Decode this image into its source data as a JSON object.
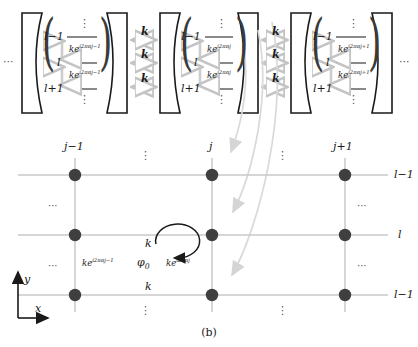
{
  "figure": {
    "caption": "(b)",
    "ellipsis_left": "···",
    "ellipsis_right": "···",
    "vdots": "⋮",
    "hdots": "···"
  },
  "cavity_panel": {
    "cavities": [
      {
        "id": "cavity-j-minus-1",
        "levels": [
          "l−1",
          "l",
          "l+1"
        ],
        "coupling_labels": [
          "ke",
          "ke"
        ],
        "coupling_exponents": [
          "i2παj−1",
          "i2παj−1"
        ]
      },
      {
        "id": "cavity-j",
        "levels": [
          "l−1",
          "l",
          "l+1"
        ],
        "coupling_labels": [
          "ke",
          "ke"
        ],
        "coupling_exponents": [
          "i2παj",
          "i2παj"
        ]
      },
      {
        "id": "cavity-j-plus-1",
        "levels": [
          "l−1",
          "l",
          "l+1"
        ],
        "coupling_labels": [
          "ke",
          "ke"
        ],
        "coupling_exponents": [
          "i2παj+1",
          "i2παj+1"
        ]
      }
    ],
    "inter_cavity_couplings": [
      "k",
      "k",
      "k",
      "k",
      "k",
      "k"
    ]
  },
  "lattice": {
    "column_labels": [
      "j−1",
      "j",
      "j+1"
    ],
    "row_labels": [
      "l−1",
      "l",
      "l−1"
    ],
    "axes": {
      "x": "x",
      "y": "y"
    },
    "plaquette": {
      "flux": "φ",
      "flux_sub": "0",
      "top_coupling": "k",
      "bottom_coupling": "k",
      "left_coupling": "ke",
      "left_exponent": "i2παj−1",
      "right_coupling": "ke",
      "right_exponent": "i2παj"
    }
  },
  "colors": {
    "mirror_stroke": "#1a1a1a",
    "grid_line": "#c9c9c9",
    "node_fill": "#3f3f3f",
    "arrow_gray": "#cccccc",
    "curve_arrow": "#d5d5d5",
    "text": "#1a1a1a",
    "axis": "#1a1a1a"
  }
}
